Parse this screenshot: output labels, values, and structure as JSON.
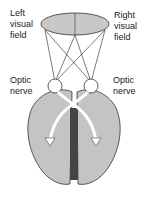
{
  "labels": {
    "left_field": "Left\nvisual\nfield",
    "right_field": "Right\nvisual\nfield",
    "optic_left": "Optic\nnerve",
    "optic_right": "Optic\nnerve"
  },
  "colors": {
    "field": "#c8c8c8",
    "brain": "#c4c4c4",
    "fissure": "#444444",
    "line": "#222222"
  }
}
